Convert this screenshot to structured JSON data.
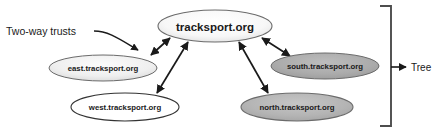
{
  "figure": {
    "background_color": "#ffffff",
    "width": 436,
    "height": 134
  },
  "nodes": {
    "root": {
      "label": "tracksport.org",
      "fill": "#f2f2f2",
      "stroke": "#6b6b6b",
      "cx": 215,
      "cy": 26,
      "rx": 57,
      "ry": 16
    },
    "east": {
      "label": "east.tracksport.org",
      "fill": "#ededed",
      "stroke": "#6b6b6b",
      "cx": 103,
      "cy": 68,
      "rx": 54,
      "ry": 13
    },
    "west": {
      "label": "west.tracksport.org",
      "fill": "#ffffff",
      "stroke": "#333333",
      "cx": 125,
      "cy": 107,
      "rx": 54,
      "ry": 14
    },
    "south": {
      "label": "south.tracksport.org",
      "fill": "#a8a8a8",
      "stroke": "#6b6b6b",
      "cx": 325,
      "cy": 66,
      "rx": 54,
      "ry": 13
    },
    "north": {
      "label": "north.tracksport.org",
      "fill": "#b3b3b3",
      "stroke": "#6b6b6b",
      "cx": 297,
      "cy": 107,
      "rx": 56,
      "ry": 14
    }
  },
  "edges": [
    {
      "name": "edge-root-east",
      "arrow": "double"
    },
    {
      "name": "edge-root-west",
      "arrow": "double"
    },
    {
      "name": "edge-root-south",
      "arrow": "double"
    },
    {
      "name": "edge-root-north",
      "arrow": "double"
    }
  ],
  "annotations": {
    "two_way_trusts": {
      "label": "Two-way trusts",
      "x": 6,
      "y": 31,
      "leader_color": "#1a1a1a"
    },
    "tree": {
      "label": "Tree",
      "x": 411,
      "y": 67,
      "bracket_color": "#4d4d4d"
    }
  },
  "colors": {
    "line": "#1a1a1a",
    "node_stroke": "#6b6b6b",
    "gray_fill": "#a8a8a8",
    "white_fill": "#ffffff",
    "bracket": "#4d4d4d"
  }
}
